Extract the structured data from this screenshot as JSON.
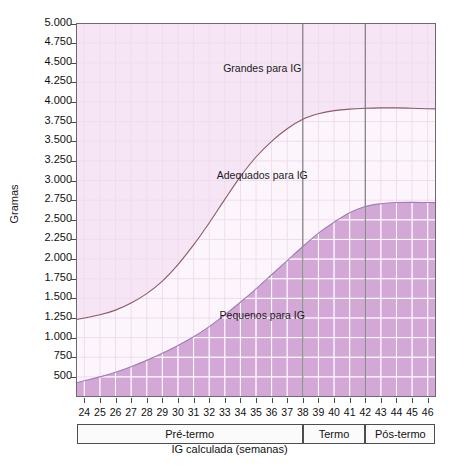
{
  "chart_data": {
    "type": "area",
    "title": "",
    "xlabel": "IG calculada (semanas)",
    "ylabel": "Gramas",
    "xlim": [
      23.5,
      46.5
    ],
    "ylim": [
      250,
      5000
    ],
    "grid": true,
    "legend_position": "inline-annotations",
    "x": [
      24,
      25,
      26,
      27,
      28,
      29,
      30,
      31,
      32,
      33,
      34,
      35,
      36,
      37,
      38,
      39,
      40,
      41,
      42,
      43,
      44,
      45,
      46
    ],
    "xticklabels": [
      "24",
      "25",
      "26",
      "27",
      "28",
      "29",
      "30",
      "31",
      "32",
      "33",
      "34",
      "35",
      "36",
      "37",
      "38",
      "39",
      "40",
      "41",
      "42",
      "43",
      "44",
      "45",
      "46"
    ],
    "yticks": [
      500,
      750,
      1000,
      1250,
      1500,
      1750,
      2000,
      2250,
      2500,
      2750,
      3000,
      3250,
      3500,
      3750,
      4000,
      4250,
      4500,
      4750,
      5000
    ],
    "yticklabels": [
      "500",
      "750",
      "1.000",
      "1.250",
      "1.500",
      "1.750",
      "2.000",
      "2.250",
      "2.500",
      "2.750",
      "3.000",
      "3.250",
      "3.500",
      "3.750",
      "4.000",
      "4.250",
      "4.500",
      "4.750",
      "5.000"
    ],
    "series": [
      {
        "name": "Limite superior (percentil alto)",
        "color": "#8a5a66",
        "values": [
          1250,
          1290,
          1350,
          1440,
          1560,
          1720,
          1930,
          2180,
          2460,
          2760,
          3050,
          3300,
          3500,
          3660,
          3780,
          3850,
          3890,
          3910,
          3920,
          3925,
          3925,
          3920,
          3915
        ]
      },
      {
        "name": "Limite inferior (percentil baixo)",
        "color": "#9b7fb5",
        "values": [
          450,
          500,
          560,
          630,
          710,
          800,
          900,
          1010,
          1140,
          1290,
          1450,
          1620,
          1800,
          1980,
          2160,
          2330,
          2470,
          2590,
          2670,
          2705,
          2720,
          2722,
          2720
        ]
      }
    ],
    "regions": [
      {
        "name": "Grandes para IG",
        "fill": "#f6e5f4",
        "x": 35.4,
        "y": 4420
      },
      {
        "name": "Adequados para IG",
        "fill": "#fdf5fc",
        "x": 35.4,
        "y": 3060
      },
      {
        "name": "Pequenos para IG",
        "fill": "#d3a7d6",
        "x": 35.4,
        "y": 1280
      }
    ],
    "vlines": [
      {
        "x": 38,
        "color": "#6a6a6a"
      },
      {
        "x": 42,
        "color": "#6a6a6a"
      }
    ],
    "gestational_bands": [
      {
        "label": "Pré-termo",
        "from": 23.5,
        "to": 38
      },
      {
        "label": "Termo",
        "from": 38,
        "to": 42
      },
      {
        "label": "Pós-termo",
        "from": 42,
        "to": 46.5
      }
    ]
  }
}
